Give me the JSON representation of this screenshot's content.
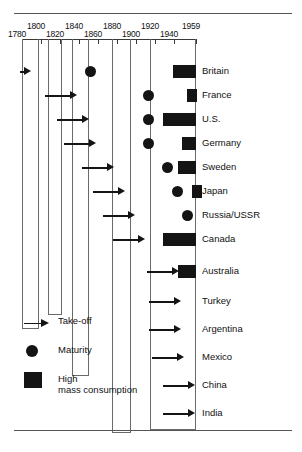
{
  "chart_data": {
    "type": "timeline",
    "title": "",
    "xlabel": "",
    "ylabel": "",
    "xlim": [
      1780,
      1959
    ],
    "axis_ticks": [
      1780,
      1800,
      1820,
      1840,
      1860,
      1880,
      1900,
      1920,
      1940,
      1959
    ],
    "axis_tick_labels": [
      "1780",
      "1800",
      "1820",
      "1840",
      "1860",
      "1880",
      "1900",
      "1920",
      "1940",
      "1959"
    ],
    "grid": true,
    "legend_position": "bottom-left",
    "legend": [
      {
        "symbol": "arrow",
        "label": "Take-off"
      },
      {
        "symbol": "dot",
        "label": "Maturity"
      },
      {
        "symbol": "box",
        "label": "High\nmass consumption"
      }
    ],
    "legend_items": {
      "takeoff": "Take-off",
      "maturity": "Maturity",
      "high_line1": "High",
      "high_line2": "mass consumption"
    },
    "series": [
      {
        "name": "Take-off",
        "symbol": "arrow"
      },
      {
        "name": "Maturity",
        "symbol": "dot"
      },
      {
        "name": "High mass consumption",
        "symbol": "box"
      }
    ],
    "categories": [
      "Britain",
      "France",
      "U.S.",
      "Germany",
      "Sweden",
      "Japan",
      "Russia/USSR",
      "Canada",
      "Australia",
      "Turkey",
      "Argentina",
      "Mexico",
      "China",
      "India"
    ],
    "rows": [
      {
        "country": "Britain",
        "takeoff": 1783,
        "maturity": 1850,
        "high_mass_consumption_start": 1935
      },
      {
        "country": "France",
        "takeoff": 1830,
        "maturity": 1910,
        "high_mass_consumption_start": 1950
      },
      {
        "country": "U.S.",
        "takeoff": 1843,
        "maturity": 1910,
        "high_mass_consumption_start": 1925
      },
      {
        "country": "Germany",
        "takeoff": 1850,
        "maturity": 1910,
        "high_mass_consumption_start": 1945
      },
      {
        "country": "Sweden",
        "takeoff": 1868,
        "maturity": 1930,
        "high_mass_consumption_start": 1940
      },
      {
        "country": "Japan",
        "takeoff": 1880,
        "maturity": 1940,
        "high_mass_consumption_start": 1955
      },
      {
        "country": "Russia/USSR",
        "takeoff": 1890,
        "maturity": 1950,
        "high_mass_consumption_start": null
      },
      {
        "country": "Canada",
        "takeoff": 1900,
        "maturity": null,
        "high_mass_consumption_start": 1925
      },
      {
        "country": "Australia",
        "takeoff": 1935,
        "maturity": null,
        "high_mass_consumption_start": 1940
      },
      {
        "country": "Turkey",
        "takeoff": 1937,
        "maturity": null,
        "high_mass_consumption_start": null
      },
      {
        "country": "Argentina",
        "takeoff": 1937,
        "maturity": null,
        "high_mass_consumption_start": null
      },
      {
        "country": "Mexico",
        "takeoff": 1940,
        "maturity": null,
        "high_mass_consumption_start": null
      },
      {
        "country": "China",
        "takeoff": 1952,
        "maturity": null,
        "high_mass_consumption_start": null
      },
      {
        "country": "India",
        "takeoff": 1952,
        "maturity": null,
        "high_mass_consumption_start": null
      }
    ]
  },
  "geometry": {
    "axis_px": {
      "x0": 22,
      "x1": 196
    },
    "ticks_px": [
      22,
      41,
      60,
      79,
      98,
      117,
      136,
      155,
      174,
      196
    ],
    "tube_pairs_px": [
      {
        "left": 22,
        "right": 39,
        "bottom": 290
      },
      {
        "left": 48,
        "right": 62,
        "bottom": 276
      },
      {
        "left": 72,
        "right": 89,
        "bottom": 337
      },
      {
        "left": 112,
        "right": 131,
        "bottom": 394
      },
      {
        "left": 150,
        "right": 196,
        "bottom": 391
      }
    ],
    "row_tops_px": [
      24,
      48,
      72,
      96,
      120,
      144,
      168,
      192,
      224,
      254,
      282,
      310,
      338,
      366
    ],
    "row_height_px": 22,
    "label_x_px": 202
  }
}
